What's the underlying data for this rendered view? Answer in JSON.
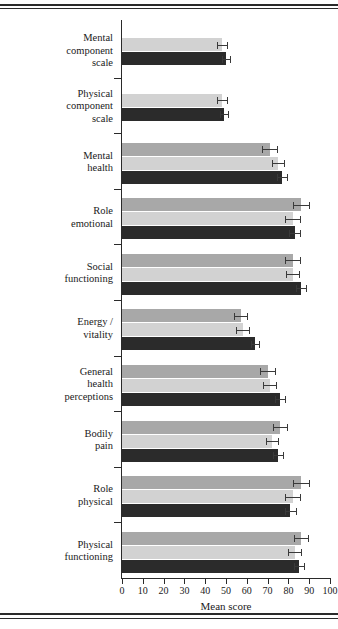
{
  "figure": {
    "xaxis_title": "Mean score",
    "tick_labels": [
      "0",
      "10",
      "20",
      "30",
      "40",
      "50",
      "60",
      "70",
      "80",
      "90",
      "100"
    ]
  },
  "chart_data": {
    "type": "bar",
    "orientation": "horizontal",
    "title": "",
    "xlabel": "Mean score",
    "ylabel": "",
    "xlim": [
      0,
      100
    ],
    "xticks": [
      0,
      10,
      20,
      30,
      40,
      50,
      60,
      70,
      80,
      90,
      100
    ],
    "grid": false,
    "legend": "none",
    "colors": {
      "medium_gray": "#a8a8a8",
      "light_gray": "#d2d2d2",
      "dark": "#2b2b2b"
    },
    "categories": [
      "Mental component scale",
      "Physical component scale",
      "Mental health",
      "Role emotional",
      "Social functioning",
      "Energy / vitality",
      "General health perceptions",
      "Bodily pain",
      "Role physical",
      "Physical functioning"
    ],
    "series": [
      {
        "name": "medium-gray",
        "color": "#a8a8a8",
        "values": [
          null,
          null,
          71,
          86,
          82,
          57,
          70,
          76,
          86,
          86
        ],
        "errors": [
          null,
          null,
          3.5,
          4.0,
          3.5,
          3.0,
          3.5,
          3.5,
          4.0,
          3.5
        ]
      },
      {
        "name": "light-gray",
        "color": "#d2d2d2",
        "values": [
          48,
          48,
          75,
          82,
          82,
          58,
          71,
          72,
          82,
          83
        ],
        "errors": [
          2.5,
          2.5,
          3.0,
          3.5,
          3.0,
          3.0,
          3.0,
          3.0,
          3.5,
          3.0
        ]
      },
      {
        "name": "dark",
        "color": "#2b2b2b",
        "values": [
          50,
          49,
          77,
          83,
          86,
          64,
          76,
          75,
          81,
          85
        ],
        "errors": [
          2.0,
          2.0,
          2.5,
          2.5,
          2.5,
          2.0,
          2.5,
          2.5,
          2.5,
          2.5
        ]
      }
    ]
  },
  "labels": {
    "mental_component_scale": [
      "Mental",
      "component",
      "scale"
    ],
    "physical_component_scale": [
      "Physical",
      "component",
      "scale"
    ],
    "mental_health": [
      "Mental",
      "health"
    ],
    "role_emotional": [
      "Role",
      "emotional"
    ],
    "social_functioning": [
      "Social",
      "functioning"
    ],
    "energy_vitality": [
      "Energy /",
      "vitality"
    ],
    "general_health_perceptions": [
      "General",
      "health",
      "perceptions"
    ],
    "bodily_pain": [
      "Bodily",
      "pain"
    ],
    "role_physical": [
      "Role",
      "physical"
    ],
    "physical_functioning": [
      "Physical",
      "functioning"
    ]
  }
}
